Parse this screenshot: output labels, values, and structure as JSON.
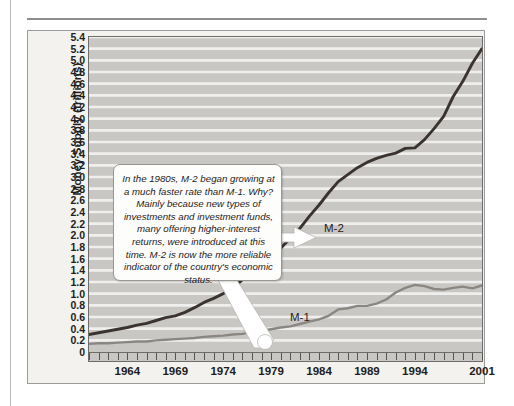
{
  "figure": {
    "y_axis_title": "Money Supply (trillions)",
    "callout_text": "In the 1980s, M-2 began growing at a much faster rate than M-1. Why? Mainly because new types of investments and investment funds, many offering higher-interest returns, were introduced at this time. M-2 is now the more reliable indicator of the country's economic status."
  },
  "colors": {
    "plot_background": "#c9c7c4",
    "gridline": "#efefee",
    "figure_background": "#f4f2ef",
    "m2_line": "#3a3330",
    "m1_line": "#8a8783",
    "axis": "#6e6c6a",
    "text": "#211d1c",
    "callout_background": "#fdfdfc",
    "pointer": "#ffffff"
  },
  "chart_data": {
    "type": "line",
    "title": "",
    "xlabel": "",
    "ylabel": "Money Supply (trillions)",
    "xlim": [
      1960,
      2001
    ],
    "ylim": [
      0,
      5.4
    ],
    "grid": true,
    "legend": "inline-labels",
    "y_ticks": [
      "0",
      "0.2",
      "0.4",
      "0.6",
      "0.8",
      "1.0",
      "1.2",
      "1.4",
      "1.6",
      "1.8",
      "2.0",
      "2.2",
      "2.4",
      "2.6",
      "2.8",
      "3.0",
      "3.2",
      "3.4",
      "3.6",
      "3.8",
      "4.0",
      "4.2",
      "4.4",
      "4.6",
      "4.8",
      "5.0",
      "5.2",
      "5.4"
    ],
    "x_ticks_labeled": [
      "1964",
      "1969",
      "1974",
      "1979",
      "1984",
      "1989",
      "1994",
      "2001"
    ],
    "x_tick_values": [
      1964,
      1969,
      1974,
      1979,
      1984,
      1989,
      1994,
      2001
    ],
    "x_minor_tick_start": 1960,
    "x_minor_tick_end": 2001,
    "x_minor_tick_step": 1,
    "x": [
      1960,
      1961,
      1962,
      1963,
      1964,
      1965,
      1966,
      1967,
      1968,
      1969,
      1970,
      1971,
      1972,
      1973,
      1974,
      1975,
      1976,
      1977,
      1978,
      1979,
      1980,
      1981,
      1982,
      1983,
      1984,
      1985,
      1986,
      1987,
      1988,
      1989,
      1990,
      1991,
      1992,
      1993,
      1994,
      1995,
      1996,
      1997,
      1998,
      1999,
      2000,
      2001
    ],
    "series": [
      {
        "name": "M-2",
        "label": "M-2",
        "color": "#3a3330",
        "values": [
          0.3,
          0.33,
          0.36,
          0.39,
          0.42,
          0.46,
          0.49,
          0.54,
          0.59,
          0.62,
          0.68,
          0.76,
          0.85,
          0.92,
          1.0,
          1.09,
          1.24,
          1.38,
          1.5,
          1.63,
          1.78,
          1.95,
          2.12,
          2.33,
          2.52,
          2.73,
          2.92,
          3.04,
          3.16,
          3.25,
          3.32,
          3.37,
          3.41,
          3.49,
          3.5,
          3.64,
          3.83,
          4.04,
          4.38,
          4.64,
          4.95,
          5.2
        ]
      },
      {
        "name": "M-1",
        "label": "M-1",
        "color": "#8a8783",
        "values": [
          0.14,
          0.15,
          0.15,
          0.16,
          0.17,
          0.18,
          0.18,
          0.2,
          0.21,
          0.22,
          0.23,
          0.24,
          0.26,
          0.27,
          0.28,
          0.3,
          0.31,
          0.34,
          0.36,
          0.39,
          0.42,
          0.44,
          0.48,
          0.52,
          0.56,
          0.62,
          0.73,
          0.75,
          0.79,
          0.79,
          0.83,
          0.9,
          1.02,
          1.1,
          1.15,
          1.13,
          1.08,
          1.07,
          1.1,
          1.12,
          1.09,
          1.14
        ]
      }
    ],
    "annotations": [
      {
        "name": "m2-callout",
        "text": "In the 1980s, M-2 began growing at a much faster rate than M-1. Why? Mainly because new types of investments and investment funds, many offering higher-interest returns, were introduced at this time. M-2 is now the more reliable indicator of the country's economic status.",
        "points_to": [
          "M-2",
          "M-1"
        ]
      }
    ]
  }
}
